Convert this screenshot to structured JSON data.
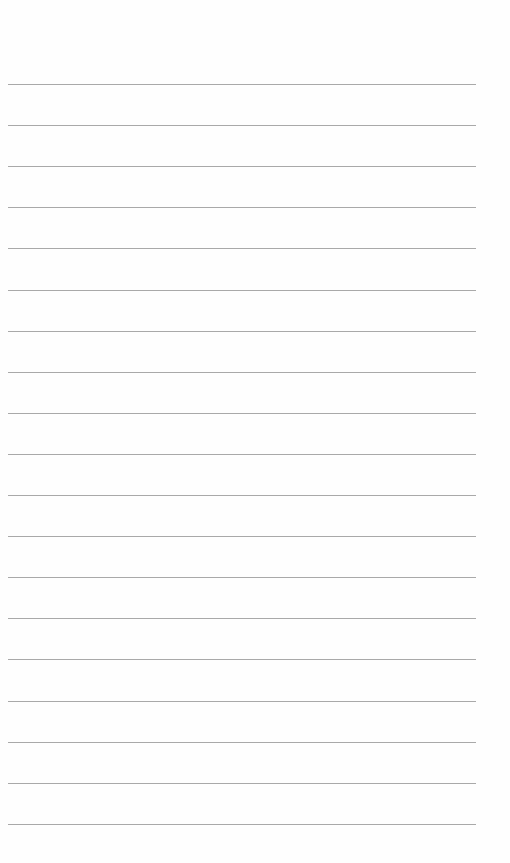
{
  "page": {
    "type": "lined-paper",
    "line_count": 19,
    "first_line_y": 84,
    "line_spacing": 41.1,
    "line_color": "#a9a9a9",
    "background": "#fefefe"
  }
}
